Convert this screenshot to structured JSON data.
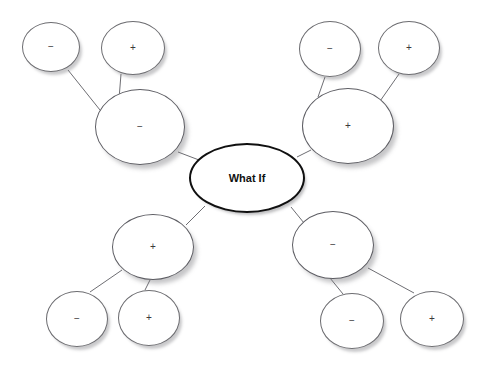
{
  "diagram": {
    "title": "What If",
    "type": "what-if-analysis-tree",
    "center": {
      "id": "center",
      "label": "What If",
      "cx": 247,
      "cy": 178,
      "rx": 58,
      "ry": 35
    },
    "branches": [
      {
        "id": "branch-top-left",
        "label": "−",
        "sign": "minus",
        "cx": 140,
        "cy": 127,
        "rx": 45,
        "ry": 38,
        "leaves": [
          {
            "id": "leaf-top-left-1",
            "label": "−",
            "sign": "minus",
            "cx": 51,
            "cy": 47,
            "rx": 29,
            "ry": 25
          },
          {
            "id": "leaf-top-left-2",
            "label": "+",
            "sign": "plus",
            "cx": 133,
            "cy": 48,
            "rx": 32,
            "ry": 27
          }
        ]
      },
      {
        "id": "branch-top-right",
        "label": "+",
        "sign": "plus",
        "cx": 348,
        "cy": 126,
        "rx": 46,
        "ry": 38,
        "leaves": [
          {
            "id": "leaf-top-right-1",
            "label": "−",
            "sign": "minus",
            "cx": 330,
            "cy": 49,
            "rx": 31,
            "ry": 28
          },
          {
            "id": "leaf-top-right-2",
            "label": "+",
            "sign": "plus",
            "cx": 409,
            "cy": 48,
            "rx": 31,
            "ry": 27
          }
        ]
      },
      {
        "id": "branch-bottom-left",
        "label": "+",
        "sign": "plus",
        "cx": 153,
        "cy": 247,
        "rx": 41,
        "ry": 33,
        "leaves": [
          {
            "id": "leaf-bottom-left-1",
            "label": "−",
            "sign": "minus",
            "cx": 77,
            "cy": 319,
            "rx": 31,
            "ry": 28
          },
          {
            "id": "leaf-bottom-left-2",
            "label": "+",
            "sign": "plus",
            "cx": 149,
            "cy": 318,
            "rx": 31,
            "ry": 28
          }
        ]
      },
      {
        "id": "branch-bottom-right",
        "label": "−",
        "sign": "minus",
        "cx": 333,
        "cy": 245,
        "rx": 41,
        "ry": 34,
        "leaves": [
          {
            "id": "leaf-bottom-right-1",
            "label": "−",
            "sign": "minus",
            "cx": 352,
            "cy": 321,
            "rx": 32,
            "ry": 28
          },
          {
            "id": "leaf-bottom-right-2",
            "label": "+",
            "sign": "plus",
            "cx": 432,
            "cy": 319,
            "rx": 32,
            "ry": 28
          }
        ]
      }
    ],
    "edges": [
      {
        "id": "edge-center-top-left",
        "from": "center",
        "to": "branch-top-left",
        "x1": 199,
        "y1": 160,
        "x2": 178,
        "y2": 152
      },
      {
        "id": "edge-center-top-right",
        "from": "center",
        "to": "branch-top-right",
        "x1": 297,
        "y1": 157,
        "x2": 311,
        "y2": 150
      },
      {
        "id": "edge-center-bottom-left",
        "from": "center",
        "to": "branch-bottom-left",
        "x1": 205,
        "y1": 206,
        "x2": 186,
        "y2": 225
      },
      {
        "id": "edge-center-bottom-right",
        "from": "center",
        "to": "branch-bottom-right",
        "x1": 291,
        "y1": 207,
        "x2": 304,
        "y2": 223
      },
      {
        "id": "edge-tl-leaf1",
        "from": "branch-top-left",
        "to": "leaf-top-left-1",
        "x1": 104,
        "y1": 115,
        "x2": 68,
        "y2": 70
      },
      {
        "id": "edge-tl-leaf2",
        "from": "branch-top-left",
        "to": "leaf-top-left-2",
        "x1": 119,
        "y1": 99,
        "x2": 121,
        "y2": 74
      },
      {
        "id": "edge-tr-leaf1",
        "from": "branch-top-right",
        "to": "leaf-top-right-1",
        "x1": 318,
        "y1": 97,
        "x2": 325,
        "y2": 77
      },
      {
        "id": "edge-tr-leaf2",
        "from": "branch-top-right",
        "to": "leaf-top-right-2",
        "x1": 378,
        "y1": 104,
        "x2": 399,
        "y2": 74
      },
      {
        "id": "edge-bl-leaf1",
        "from": "branch-bottom-left",
        "to": "leaf-bottom-left-1",
        "x1": 122,
        "y1": 270,
        "x2": 90,
        "y2": 292
      },
      {
        "id": "edge-bl-leaf2",
        "from": "branch-bottom-left",
        "to": "leaf-bottom-left-2",
        "x1": 150,
        "y1": 280,
        "x2": 145,
        "y2": 290
      },
      {
        "id": "edge-br-leaf1",
        "from": "branch-bottom-right",
        "to": "leaf-bottom-right-1",
        "x1": 330,
        "y1": 278,
        "x2": 343,
        "y2": 294
      },
      {
        "id": "edge-br-leaf2",
        "from": "branch-bottom-right",
        "to": "leaf-bottom-right-2",
        "x1": 368,
        "y1": 268,
        "x2": 414,
        "y2": 293
      }
    ],
    "style": {
      "background": "#ffffff",
      "node_fill": "#ffffff",
      "node_stroke": "#6c6c70",
      "center_stroke": "#101010",
      "edge_stroke": "#6e6e73",
      "label_color": "#262626"
    }
  }
}
